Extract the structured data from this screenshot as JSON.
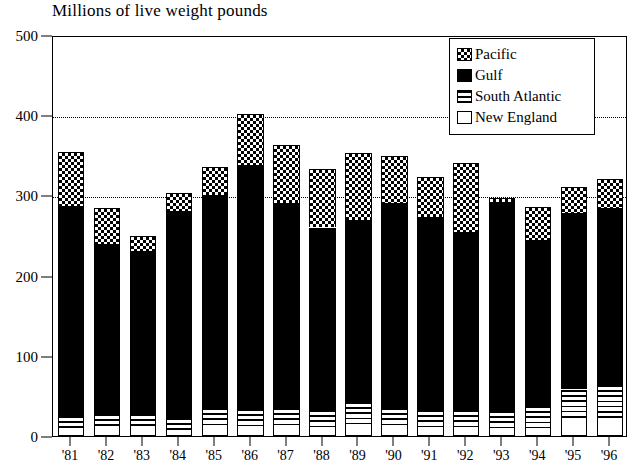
{
  "chart_data": {
    "type": "bar",
    "subtype": "stacked-bar",
    "title": "Millions of live weight pounds",
    "xlabel": "",
    "ylabel": "",
    "ylim": [
      0,
      500
    ],
    "yticks": [
      0,
      100,
      200,
      300,
      400,
      500
    ],
    "gridlines": [
      300,
      400
    ],
    "grid": "horizontal-dotted",
    "legend_position": "top-right",
    "categories": [
      "'81",
      "'82",
      "'83",
      "'84",
      "'85",
      "'86",
      "'87",
      "'88",
      "'89",
      "'90",
      "'91",
      "'92",
      "'93",
      "'94",
      "'95",
      "'96"
    ],
    "series": [
      {
        "name": "New England",
        "pattern": "new-england",
        "values": [
          10,
          10,
          8,
          8,
          10,
          12,
          10,
          8,
          12,
          10,
          8,
          8,
          6,
          8,
          20,
          22
        ]
      },
      {
        "name": "South Atlantic",
        "pattern": "south-atlantic",
        "values": [
          15,
          17,
          20,
          15,
          25,
          22,
          25,
          25,
          30,
          25,
          25,
          25,
          25,
          30,
          38,
          42
        ]
      },
      {
        "name": "Gulf",
        "pattern": "gulf",
        "values": [
          262,
          213,
          203,
          257,
          265,
          304,
          256,
          227,
          227,
          255,
          240,
          222,
          261,
          207,
          220,
          220
        ]
      },
      {
        "name": "Pacific",
        "pattern": "pacific",
        "values": [
          67,
          44,
          19,
          23,
          35,
          64,
          72,
          73,
          84,
          59,
          50,
          85,
          5,
          41,
          33,
          37
        ]
      }
    ],
    "totals": [
      354,
      284,
      250,
      303,
      335,
      402,
      363,
      333,
      353,
      349,
      323,
      340,
      297,
      286,
      311,
      321
    ]
  },
  "legend": {
    "items": [
      {
        "label": "Pacific",
        "pattern": "pacific"
      },
      {
        "label": "Gulf",
        "pattern": "gulf"
      },
      {
        "label": "South Atlantic",
        "pattern": "south-atlantic"
      },
      {
        "label": "New England",
        "pattern": "new-england"
      }
    ]
  }
}
